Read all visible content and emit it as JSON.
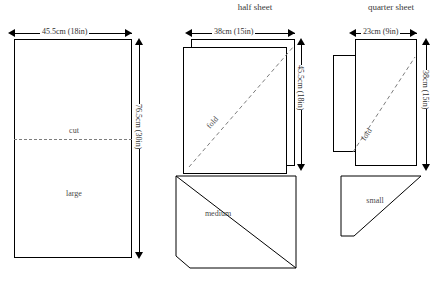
{
  "diagram": {
    "panels": [
      {
        "id": "full-sheet",
        "title": "",
        "width_label": "45.5cm (18in)",
        "height_label": "76.5cm (30in)",
        "piece_labels": [
          "cut",
          "large"
        ],
        "cut_line": "cut"
      },
      {
        "id": "half-sheet",
        "title": "half sheet",
        "width_label": "38cm (15in)",
        "height_label": "45.5cm (18in)",
        "fold_label": "fold",
        "piece_label": "medium"
      },
      {
        "id": "quarter-sheet",
        "title": "quarter sheet",
        "width_label": "23cm (9in)",
        "height_label": "38cm (15in)",
        "fold_label": "fold",
        "piece_label": "small"
      }
    ],
    "labels": {
      "cut": "cut",
      "large": "large",
      "medium": "medium",
      "small": "small",
      "fold": "fold"
    },
    "colors": {
      "stroke": "#000000",
      "dashed": "#7d7d7d",
      "text": "#2e2e2e"
    }
  }
}
